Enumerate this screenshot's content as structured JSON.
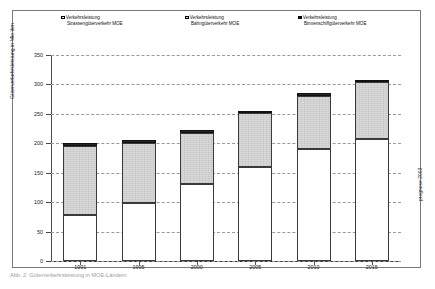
{
  "legend": {
    "items": [
      {
        "name": "road",
        "line1": "Verkehrsleistung",
        "line2": "Strassengüterverkehr MOE",
        "color": "#ffffff"
      },
      {
        "name": "rail",
        "line1": "Verkehrsleistung",
        "line2": "Bahngüterverkehr MOE",
        "color": "#d9d9d9"
      },
      {
        "name": "waterway",
        "line1": "Verkehrsleistung",
        "line2": "Binnenschiffgüterverkehr MOE",
        "color": "#262626"
      }
    ]
  },
  "annotations": {
    "right_note": "prognose 2003",
    "caption": "Abb. 2: Güterverkehrsleistung in MOE-Ländern"
  },
  "chart_data": {
    "type": "bar",
    "title": "",
    "subtype": "stacked-column",
    "categories": [
      "1991",
      "1995",
      "2000",
      "2005",
      "2010",
      "2015"
    ],
    "series": [
      {
        "name": "Verkehrsleistung Strassengüterverkehr MOE",
        "color": "#ffffff",
        "values": [
          78,
          98,
          130,
          160,
          190,
          208
        ]
      },
      {
        "name": "Verkehrsleistung Bahngüterverkehr MOE",
        "color": "#d9d9d9",
        "values": [
          118,
          103,
          88,
          91,
          91,
          96
        ]
      },
      {
        "name": "Verkehrsleistung Binnenschiffgüterverkehr MOE",
        "color": "#262626",
        "values": [
          4,
          4,
          4,
          4,
          4,
          4
        ]
      }
    ],
    "totals": [
      200,
      205,
      222,
      255,
      285,
      308
    ],
    "xlabel": "",
    "ylabel": "Güterverkehrsleistung in Mio tkm",
    "ylim": [
      0,
      350
    ],
    "yticks": [
      0,
      50,
      100,
      150,
      200,
      250,
      300,
      350
    ],
    "grid": true,
    "legend_position": "top"
  }
}
